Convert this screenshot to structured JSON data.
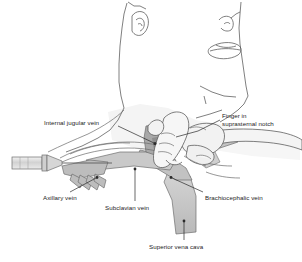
{
  "figure": {
    "background_color": "#ffffff",
    "line_color": "#4a4a4a",
    "text_color": "#1b1b1b",
    "vein_fill_light": "#c9c9c9",
    "vein_fill_mid": "#b4b4b4",
    "vein_fill_dark": "#8e8e8e",
    "skin_fill": "#efefef",
    "syringe_fill": "#dcdcdc"
  },
  "labels": [
    {
      "id": "internal-jugular-vein",
      "text": "Internal jugular vein",
      "x": 44,
      "y": 119,
      "align": "left"
    },
    {
      "id": "finger-in-suprasternal-notch",
      "text": "Finger in\nsuprasternal notch",
      "x": 222,
      "y": 114,
      "align": "left"
    },
    {
      "id": "axillary-vein",
      "text": "Axillary vein",
      "x": 43,
      "y": 194,
      "align": "left"
    },
    {
      "id": "subclavian-vein",
      "text": "Subclavian vein",
      "x": 105,
      "y": 204,
      "align": "left"
    },
    {
      "id": "brachiocephalic-vein",
      "text": "Brachiocephalic vein",
      "x": 205,
      "y": 194,
      "align": "left"
    },
    {
      "id": "superior-vena-cava",
      "text": "Superior vena cava",
      "x": 149,
      "y": 243,
      "align": "left"
    }
  ],
  "structures": [
    {
      "id": "head-and-neck",
      "name": "Head and neck profile outline"
    },
    {
      "id": "face",
      "name": "Nose and lips profile"
    },
    {
      "id": "ear",
      "name": "Ear outline"
    },
    {
      "id": "chest-shoulder",
      "name": "Chest and shoulder contour"
    },
    {
      "id": "clavicle",
      "name": "Clavicle outline"
    },
    {
      "id": "hand",
      "name": "Hand with index finger in suprasternal notch"
    },
    {
      "id": "forearm",
      "name": "Forearm extending to right"
    },
    {
      "id": "syringe",
      "name": "Syringe with needle approaching from left"
    },
    {
      "id": "internal-jugular-vein-shape",
      "name": "Internal jugular vein"
    },
    {
      "id": "axillary-vein-shape",
      "name": "Axillary vein with tributaries"
    },
    {
      "id": "subclavian-vein-shape",
      "name": "Subclavian vein"
    },
    {
      "id": "brachiocephalic-vein-shape",
      "name": "Brachiocephalic vein"
    },
    {
      "id": "superior-vena-cava-shape",
      "name": "Superior vena cava"
    }
  ]
}
